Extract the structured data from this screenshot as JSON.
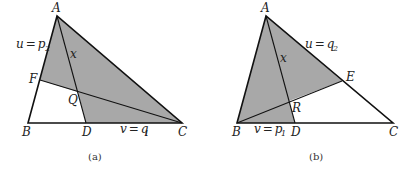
{
  "colors": {
    "shade": "#a8a8a8",
    "line": "#111111",
    "background": "#ffffff"
  },
  "panels": [
    {
      "caption": "(a)",
      "points": {
        "A": {
          "label": "A",
          "x": 57,
          "y": 16
        },
        "B": {
          "label": "B",
          "x": 28,
          "y": 123
        },
        "C": {
          "label": "C",
          "x": 182,
          "y": 123
        },
        "D": {
          "label": "D",
          "x": 86,
          "y": 123
        },
        "F": {
          "label": "F",
          "x": 40,
          "y": 80
        },
        "Q": {
          "label": "Q",
          "x": 78,
          "y": 92
        }
      },
      "segment_labels": {
        "AF": {
          "var": "u",
          "eq": "=",
          "val": "p",
          "sub": "2"
        },
        "DC": {
          "var": "v",
          "eq": "=",
          "val": "q",
          "sub": "1"
        },
        "AQ": {
          "var": "x"
        }
      },
      "shaded_region": [
        "A",
        "F",
        "Q",
        "D",
        "C"
      ]
    },
    {
      "caption": "(b)",
      "points": {
        "A": {
          "label": "A",
          "x": 266,
          "y": 16
        },
        "B": {
          "label": "B",
          "x": 237,
          "y": 123
        },
        "C": {
          "label": "C",
          "x": 393,
          "y": 123
        },
        "D": {
          "label": "D",
          "x": 295,
          "y": 123
        },
        "E": {
          "label": "E",
          "x": 342,
          "y": 81
        },
        "R": {
          "label": "R",
          "x": 289,
          "y": 101
        }
      },
      "segment_labels": {
        "AE": {
          "var": "u",
          "eq": "=",
          "val": "q",
          "sub": "2"
        },
        "BD": {
          "var": "v",
          "eq": "=",
          "val": "p",
          "sub": "1"
        },
        "AR": {
          "var": "x"
        }
      },
      "shaded_region": [
        "A",
        "B",
        "D",
        "R",
        "E"
      ]
    }
  ]
}
